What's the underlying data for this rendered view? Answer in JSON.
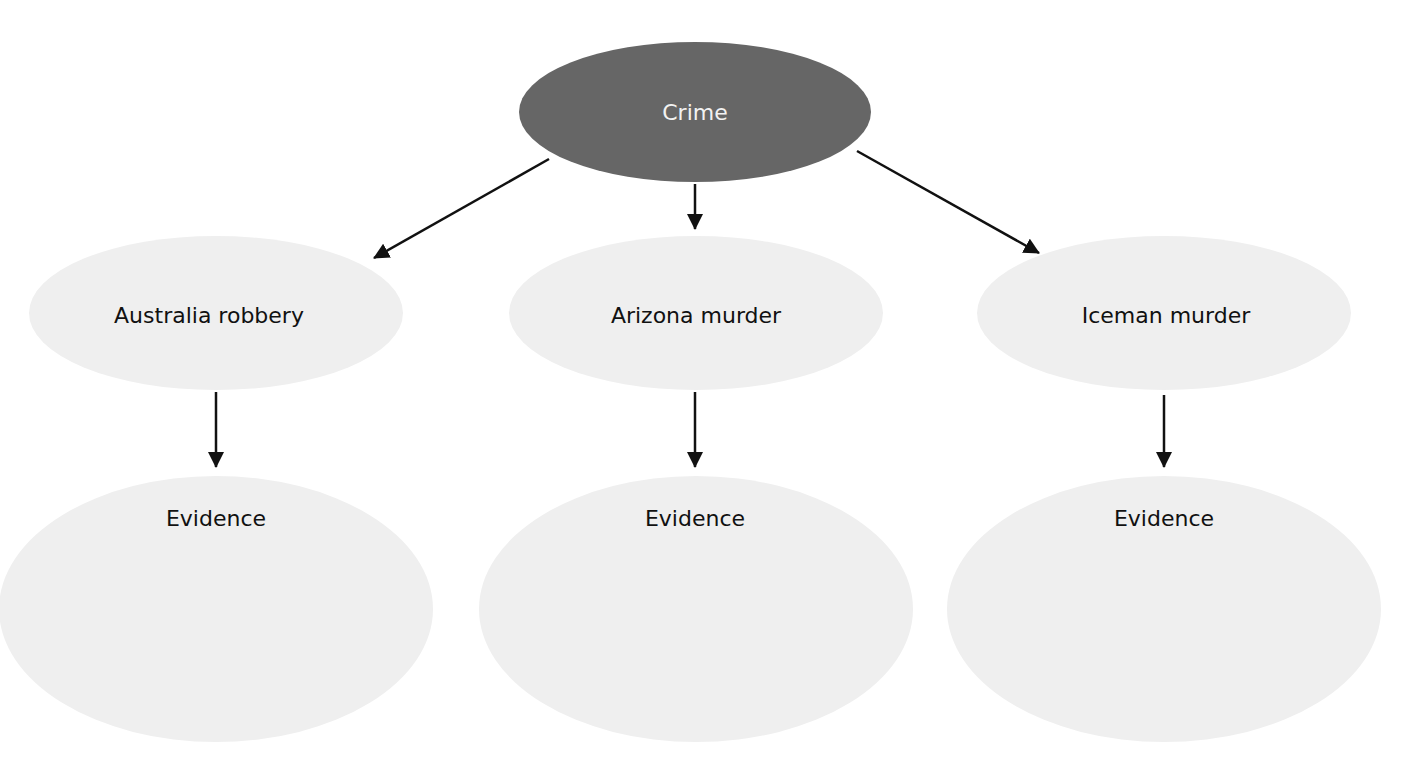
{
  "diagram": {
    "type": "hierarchy",
    "colors": {
      "root_fill": "#666666",
      "node_fill": "#efefef",
      "root_text": "#f2f2f2",
      "node_text": "#111111",
      "arrow": "#111111",
      "background": "#ffffff"
    },
    "root": {
      "label": "Crime"
    },
    "cases": [
      {
        "label": "Australia robbery",
        "child": {
          "label": "Evidence"
        }
      },
      {
        "label": "Arizona murder",
        "child": {
          "label": "Evidence"
        }
      },
      {
        "label": "Iceman murder",
        "child": {
          "label": "Evidence"
        }
      }
    ],
    "edges": [
      {
        "from": "Crime",
        "to": "Australia robbery"
      },
      {
        "from": "Crime",
        "to": "Arizona murder"
      },
      {
        "from": "Crime",
        "to": "Iceman murder"
      },
      {
        "from": "Australia robbery",
        "to": "Evidence"
      },
      {
        "from": "Arizona murder",
        "to": "Evidence"
      },
      {
        "from": "Iceman murder",
        "to": "Evidence"
      }
    ]
  }
}
